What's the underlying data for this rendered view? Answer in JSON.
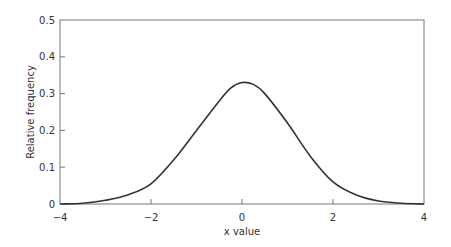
{
  "chart_data": {
    "type": "line",
    "title": "",
    "xlabel": "x value",
    "ylabel": "Relative frequency",
    "xlim": [
      -4,
      4
    ],
    "ylim": [
      0,
      0.5
    ],
    "xticks": [
      -4,
      -2,
      0,
      2,
      4
    ],
    "xtick_labels": [
      "−4",
      "−2",
      "0",
      "2",
      "4"
    ],
    "yticks": [
      0,
      0.1,
      0.2,
      0.3,
      0.4,
      0.5
    ],
    "ytick_labels": [
      "0",
      "0.1",
      "0.2",
      "0.3",
      "0.4",
      "0.5"
    ],
    "grid": false,
    "legend": null,
    "series": [
      {
        "name": "distribution",
        "color": "#333333",
        "x": [
          -4,
          -3.5,
          -3,
          -2.5,
          -2,
          -1.5,
          -1,
          -0.5,
          -0.25,
          0,
          0.25,
          0.5,
          1,
          1.5,
          2,
          2.5,
          3,
          3.5,
          4
        ],
        "y": [
          0.0,
          0.002,
          0.01,
          0.025,
          0.055,
          0.12,
          0.2,
          0.28,
          0.315,
          0.33,
          0.325,
          0.3,
          0.22,
          0.13,
          0.06,
          0.025,
          0.008,
          0.002,
          0.0
        ]
      }
    ]
  }
}
